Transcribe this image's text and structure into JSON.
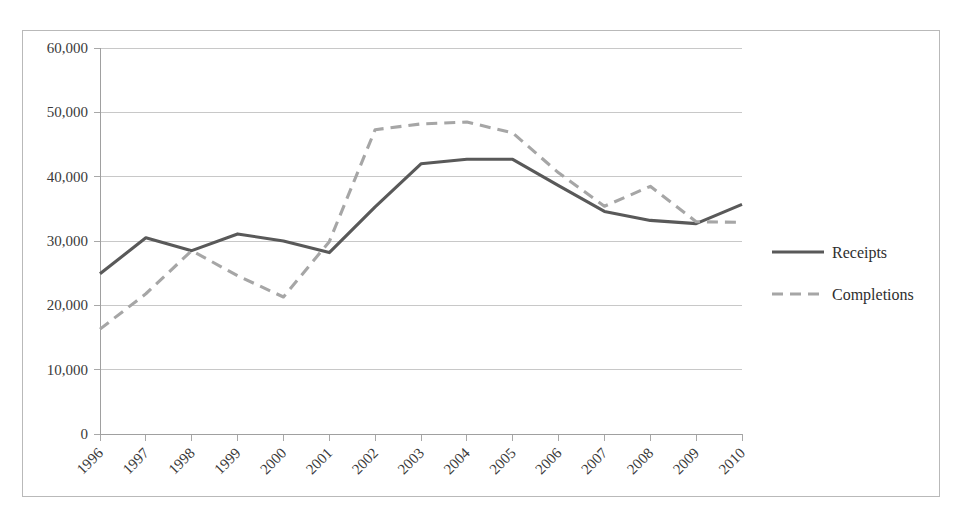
{
  "chart_data": {
    "type": "line",
    "title": "",
    "xlabel": "",
    "ylabel": "",
    "categories": [
      "1996",
      "1997",
      "1998",
      "1999",
      "2000",
      "2001",
      "2002",
      "2003",
      "2004",
      "2005",
      "2006",
      "2007",
      "2008",
      "2009",
      "2010"
    ],
    "series": [
      {
        "name": "Receipts",
        "style": "solid",
        "color": "#595959",
        "values": [
          24900,
          30500,
          28500,
          31100,
          30000,
          28200,
          35300,
          42000,
          42700,
          42700,
          38600,
          34600,
          33200,
          32700,
          35700
        ]
      },
      {
        "name": "Completions",
        "style": "dashed",
        "color": "#a6a6a6",
        "values": [
          16300,
          21800,
          28500,
          24600,
          21300,
          29900,
          47300,
          48200,
          48500,
          46800,
          40600,
          35400,
          38500,
          33000,
          32900
        ]
      }
    ],
    "ylim": [
      0,
      60000
    ],
    "y_ticks": [
      "0",
      "10,000",
      "20,000",
      "30,000",
      "40,000",
      "50,000",
      "60,000"
    ],
    "y_tick_values": [
      0,
      10000,
      20000,
      30000,
      40000,
      50000,
      60000
    ],
    "grid": true,
    "legend_position": "right",
    "legend_entries": [
      {
        "label": "Receipts",
        "style": "solid"
      },
      {
        "label": "Completions",
        "style": "dashed"
      }
    ],
    "colors": {
      "receipts": "#595959",
      "completions": "#a6a6a6",
      "gridline": "#c8c8c8",
      "axis": "#a0a0a0",
      "border": "#b9b9b9",
      "text": "#3a3a3a"
    }
  }
}
